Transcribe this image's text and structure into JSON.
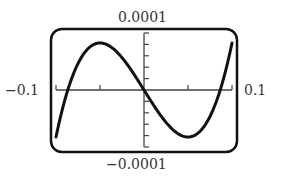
{
  "chart_data": {
    "type": "line",
    "title": "",
    "xlabel": "",
    "ylabel": "",
    "xlim": [
      -0.1,
      0.1
    ],
    "ylim": [
      -0.0001,
      0.0001
    ],
    "grid": false,
    "legend": null,
    "window_labels": {
      "xmin": "−0.1",
      "xmax": "0.1",
      "ymin": "−0.0001",
      "ymax": "0.0001"
    },
    "x_ticks": [
      -0.1,
      -0.05,
      0,
      0.05,
      0.1
    ],
    "y_ticks": [
      -0.0001,
      -8e-05,
      -6e-05,
      -4e-05,
      -2e-05,
      0,
      2e-05,
      4e-05,
      6e-05,
      8e-05,
      0.0001
    ],
    "series": [
      {
        "name": "cubic curve",
        "x": [
          -0.1,
          -0.09,
          -0.08,
          -0.07,
          -0.06,
          -0.05,
          -0.04,
          -0.03,
          -0.02,
          -0.01,
          0,
          0.01,
          0.02,
          0.03,
          0.04,
          0.05,
          0.06,
          0.07,
          0.08,
          0.09,
          0.1
        ],
        "y": [
          -8.25e-05,
          -7.8e-06,
          2.9e-05,
          6e-05,
          7.7e-05,
          8.25e-05,
          7.8e-05,
          6.53e-05,
          4.69e-05,
          2.44e-05,
          0,
          -2.44e-05,
          -4.69e-05,
          -6.53e-05,
          -7.8e-05,
          -8.25e-05,
          -7.7e-05,
          -6e-05,
          -2.9e-05,
          7.8e-06,
          8.25e-05
        ]
      }
    ],
    "annotations": [
      "Graphing calculator viewing window with rounded border"
    ]
  },
  "colors": {
    "curve": "#111111",
    "axes": "#444444",
    "frame": "#111111",
    "labels": "#333333"
  }
}
